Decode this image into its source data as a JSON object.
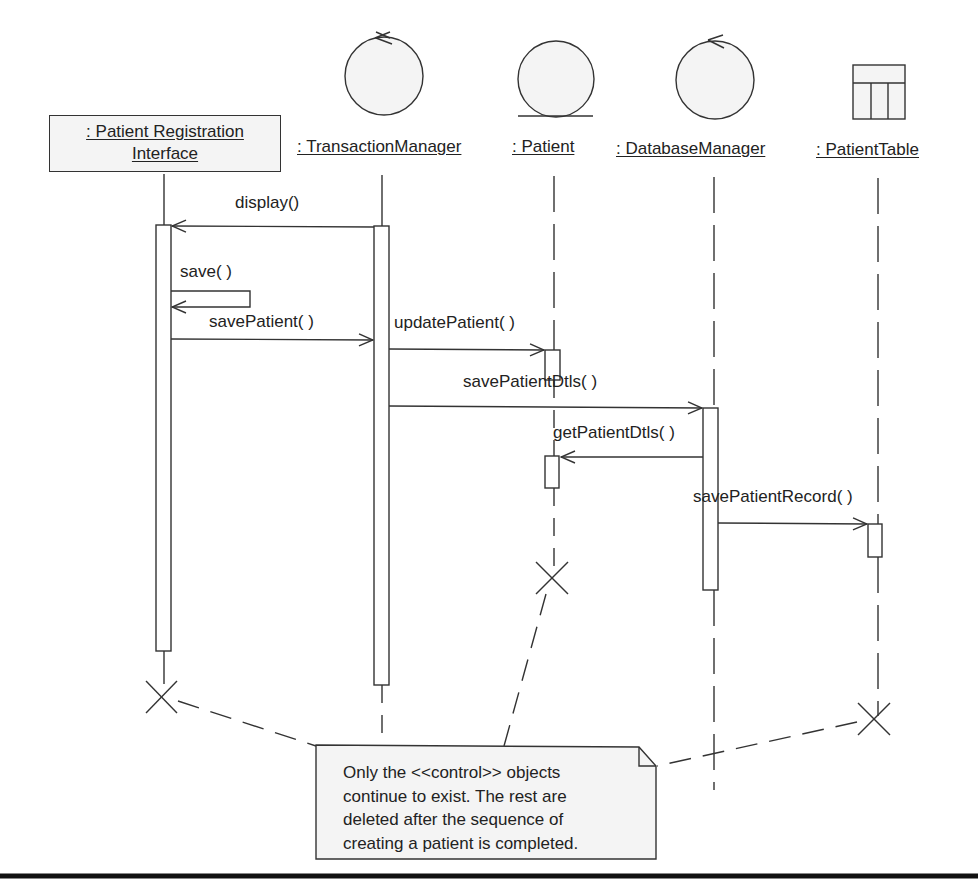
{
  "objects": [
    {
      "id": "pri",
      "name_line1": ": Patient Registration",
      "name_line2": "Interface",
      "stereotype": "boundary"
    },
    {
      "id": "tm",
      "name": ": TransactionManager",
      "stereotype": "control"
    },
    {
      "id": "patient",
      "name": ": Patient",
      "stereotype": "entity"
    },
    {
      "id": "dbm",
      "name": ": DatabaseManager",
      "stereotype": "control"
    },
    {
      "id": "table",
      "name": ": PatientTable",
      "stereotype": "table"
    }
  ],
  "messages": [
    {
      "label": "display()",
      "from": "tm",
      "to": "pri"
    },
    {
      "label": "save( )",
      "from": "pri",
      "to": "pri"
    },
    {
      "label": "savePatient( )",
      "from": "pri",
      "to": "tm"
    },
    {
      "label": "updatePatient( )",
      "from": "tm",
      "to": "patient"
    },
    {
      "label": "savePatientDtls( )",
      "from": "tm",
      "to": "dbm"
    },
    {
      "label": "getPatientDtls( )",
      "from": "dbm",
      "to": "patient"
    },
    {
      "label": "savePatientRecord( )",
      "from": "dbm",
      "to": "table"
    }
  ],
  "note": {
    "lines": [
      "Only the <<control>> objects",
      "continue to exist. The rest are",
      "deleted after the sequence of",
      "creating a patient is completed."
    ]
  },
  "colors": {
    "stroke": "#333333",
    "fill": "#f4f4f4",
    "text": "#222222"
  }
}
